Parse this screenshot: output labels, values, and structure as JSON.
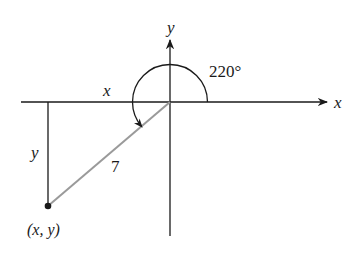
{
  "diagram": {
    "type": "reference-angle-triangle",
    "angle_label": "220°",
    "angle_degrees": 220,
    "hypotenuse_label": "7",
    "horizontal_leg_label": "x",
    "vertical_leg_label": "y",
    "point_label": "(x, y)",
    "x_axis_label": "x",
    "y_axis_label": "y",
    "colors": {
      "axes": "#1a1a1a",
      "hypotenuse": "#9a9a9a",
      "legs": "#1a1a1a",
      "arc": "#1a1a1a",
      "point": "#1a1a1a",
      "background": "#ffffff"
    }
  }
}
